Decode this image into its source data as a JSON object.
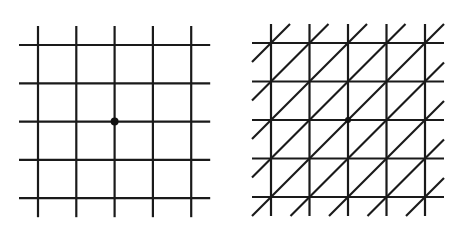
{
  "figure": {
    "stroke_color": "#1a1a1a",
    "background_color": "#ffffff",
    "panels": [
      {
        "id": "square-lattice",
        "kind": "square grid",
        "vertical_lines": 5,
        "horizontal_lines": 5,
        "diagonals": false,
        "marked_vertex": {
          "col": 2,
          "row": 2
        }
      },
      {
        "id": "triangular-lattice",
        "kind": "square grid with diagonals",
        "vertical_lines": 5,
        "horizontal_lines": 5,
        "diagonals": true,
        "diagonal_direction": "up-right",
        "marked_vertex": {
          "col": 2,
          "row": 2
        }
      }
    ]
  }
}
